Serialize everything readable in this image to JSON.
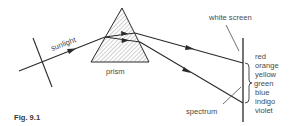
{
  "figure": {
    "caption": "Fig. 9.1"
  },
  "labels": {
    "sunlight": "sunlight",
    "prism": "prism",
    "white_screen": "white screen",
    "spectrum": "spectrum"
  },
  "spectrum_colors": [
    {
      "name": "red"
    },
    {
      "name": "orange"
    },
    {
      "name": "yellow"
    },
    {
      "name": "green"
    },
    {
      "name": "blue"
    },
    {
      "name": "indigo"
    },
    {
      "name": "violet"
    }
  ],
  "colors": {
    "line": "#2a2a2a",
    "text": "#4a4a4a",
    "background": "#ffffff"
  }
}
